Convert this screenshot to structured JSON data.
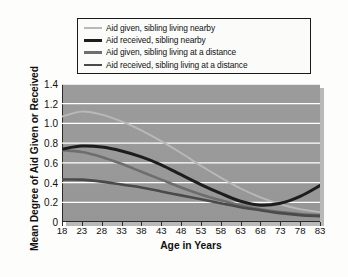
{
  "chart_data": {
    "type": "line",
    "title": "",
    "xlabel": "Age in Years",
    "ylabel": "Mean Degree of Aid Given or Received",
    "xlim": [
      18,
      83
    ],
    "ylim": [
      0,
      1.4
    ],
    "grid": true,
    "legend_position": "above-plot",
    "xticks": [
      "18",
      "23",
      "28",
      "33",
      "38",
      "43",
      "48",
      "53",
      "58",
      "63",
      "68",
      "73",
      "78",
      "83"
    ],
    "yticks": [
      "0",
      "0.2",
      "0.4",
      "0.6",
      "0.8",
      "1.0",
      "1.2",
      "1.4"
    ],
    "x": [
      18,
      23,
      28,
      33,
      38,
      43,
      48,
      53,
      58,
      63,
      68,
      73,
      78,
      83
    ],
    "series": [
      {
        "name": "Aid given, sibling living nearby",
        "color": "#b9b9b9",
        "width": 1.9,
        "values": [
          1.07,
          1.12,
          1.09,
          1.02,
          0.93,
          0.82,
          0.7,
          0.57,
          0.45,
          0.34,
          0.25,
          0.18,
          0.13,
          0.1
        ]
      },
      {
        "name": "Aid received, sibling nearby",
        "color": "#1d1d1d",
        "width": 3.0,
        "values": [
          0.74,
          0.77,
          0.76,
          0.72,
          0.66,
          0.58,
          0.48,
          0.38,
          0.29,
          0.21,
          0.17,
          0.19,
          0.26,
          0.37
        ]
      },
      {
        "name": "Aid given, sibling living at a distance",
        "color": "#6e6e6e",
        "width": 2.6,
        "values": [
          0.73,
          0.71,
          0.66,
          0.59,
          0.51,
          0.43,
          0.35,
          0.28,
          0.22,
          0.17,
          0.13,
          0.1,
          0.08,
          0.07
        ]
      },
      {
        "name": "Aid received, sibling living at a distance",
        "color": "#4a4a4a",
        "width": 2.6,
        "values": [
          0.43,
          0.43,
          0.41,
          0.38,
          0.35,
          0.31,
          0.27,
          0.23,
          0.19,
          0.15,
          0.12,
          0.09,
          0.07,
          0.06
        ]
      }
    ]
  },
  "legend": {
    "items": [
      {
        "label": "Aid given, sibling living nearby"
      },
      {
        "label": "Aid received, sibling nearby"
      },
      {
        "label": "Aid given, sibling living at a distance"
      },
      {
        "label": "Aid received, sibling living at a distance"
      }
    ]
  }
}
